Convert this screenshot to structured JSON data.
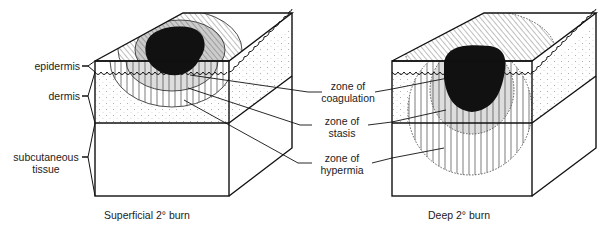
{
  "figure": {
    "left_labels": {
      "epidermis": "epidermis",
      "dermis": "dermis",
      "subcutaneous_1": "subcutaneous",
      "subcutaneous_2": "tissue"
    },
    "zone_labels": {
      "coagulation_1": "zone of",
      "coagulation_2": "coagulation",
      "stasis_1": "zone of",
      "stasis_2": "stasis",
      "hypermia_1": "zone of",
      "hypermia_2": "hypermia"
    },
    "captions": {
      "left": "Superficial 2° burn",
      "right": "Deep 2° burn"
    }
  }
}
